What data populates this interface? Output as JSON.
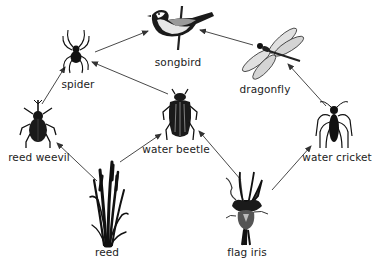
{
  "diagram": {
    "type": "food-web",
    "colors": {
      "arrow": "#333333",
      "organism": "#111111",
      "bird_belly": "#e8e8e8",
      "wing": "#d8d8d8",
      "iris_petal": "#555555",
      "label": "#222222"
    },
    "organisms": [
      {
        "id": "songbird",
        "label": "songbird",
        "icon": "songbird-icon"
      },
      {
        "id": "spider",
        "label": "spider",
        "icon": "spider-icon"
      },
      {
        "id": "dragonfly",
        "label": "dragonfly",
        "icon": "dragonfly-icon"
      },
      {
        "id": "reed_weevil",
        "label": "reed weevil",
        "icon": "weevil-icon"
      },
      {
        "id": "water_beetle",
        "label": "water beetle",
        "icon": "water-beetle-icon"
      },
      {
        "id": "water_cricket",
        "label": "water cricket",
        "icon": "water-cricket-icon"
      },
      {
        "id": "reed",
        "label": "reed",
        "icon": "reed-plant-icon"
      },
      {
        "id": "flag_iris",
        "label": "flag iris",
        "icon": "iris-flower-icon"
      }
    ],
    "edges": [
      {
        "from": "spider",
        "to": "songbird"
      },
      {
        "from": "dragonfly",
        "to": "songbird"
      },
      {
        "from": "reed_weevil",
        "to": "spider"
      },
      {
        "from": "water_beetle",
        "to": "spider"
      },
      {
        "from": "reed",
        "to": "reed_weevil"
      },
      {
        "from": "reed",
        "to": "water_beetle"
      },
      {
        "from": "flag_iris",
        "to": "water_beetle"
      },
      {
        "from": "flag_iris",
        "to": "water_cricket"
      },
      {
        "from": "water_cricket",
        "to": "dragonfly"
      }
    ]
  }
}
